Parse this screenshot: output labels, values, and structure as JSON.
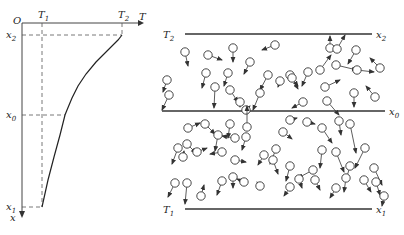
{
  "profile_graph": {
    "origin_label": "O",
    "t_axis_label": "T",
    "x_axis_label": "x",
    "t_ticks": [
      {
        "label": "T",
        "sub": "1",
        "x": 42
      },
      {
        "label": "T",
        "sub": "2",
        "x": 122
      }
    ],
    "x_ticks": [
      {
        "label": "x",
        "sub": "2",
        "y": 35
      },
      {
        "label": "x",
        "sub": "0",
        "y": 115
      },
      {
        "label": "x",
        "sub": "1",
        "y": 207
      }
    ],
    "curve_points": [
      [
        122,
        35
      ],
      [
        118,
        40
      ],
      [
        108,
        50
      ],
      [
        96,
        62
      ],
      [
        86,
        74
      ],
      [
        78,
        86
      ],
      [
        72,
        98
      ],
      [
        67,
        110
      ],
      [
        65,
        115
      ],
      [
        60,
        135
      ],
      [
        54,
        157
      ],
      [
        48,
        180
      ],
      [
        42,
        207
      ]
    ]
  },
  "molecule_panel": {
    "plates": [
      {
        "name": "top-plate",
        "temp_label": "T",
        "temp_sub": "2",
        "pos_label": "x",
        "pos_sub": "2",
        "y": 34
      },
      {
        "name": "mid-plane",
        "temp_label": "",
        "temp_sub": "",
        "pos_label": "x",
        "pos_sub": "0",
        "y": 111
      },
      {
        "name": "bottom-plate",
        "temp_label": "T",
        "temp_sub": "1",
        "pos_label": "x",
        "pos_sub": "1",
        "y": 209
      }
    ],
    "molecules": [
      [
        185,
        52,
        188,
        66
      ],
      [
        208,
        55,
        222,
        60
      ],
      [
        233,
        48,
        233,
        62
      ],
      [
        250,
        62,
        244,
        74
      ],
      [
        275,
        45,
        262,
        50
      ],
      [
        268,
        75,
        260,
        90
      ],
      [
        290,
        75,
        298,
        89
      ],
      [
        308,
        72,
        302,
        86
      ],
      [
        330,
        48,
        330,
        36
      ],
      [
        320,
        70,
        331,
        55
      ],
      [
        336,
        65,
        357,
        70
      ],
      [
        337,
        49,
        345,
        35
      ],
      [
        356,
        50,
        348,
        64
      ],
      [
        357,
        70,
        374,
        72
      ],
      [
        380,
        68,
        370,
        58
      ],
      [
        375,
        97,
        366,
        86
      ],
      [
        354,
        93,
        354,
        107
      ],
      [
        327,
        101,
        339,
        115
      ],
      [
        303,
        102,
        292,
        108
      ],
      [
        325,
        87,
        340,
        80
      ],
      [
        167,
        80,
        163,
        92
      ],
      [
        169,
        95,
        162,
        110
      ],
      [
        206,
        73,
        202,
        88
      ],
      [
        228,
        73,
        224,
        86
      ],
      [
        215,
        87,
        214,
        108
      ],
      [
        230,
        90,
        238,
        102
      ],
      [
        240,
        102,
        240,
        107
      ],
      [
        280,
        81,
        278,
        87
      ],
      [
        292,
        78,
        298,
        86
      ],
      [
        260,
        93,
        253,
        110
      ],
      [
        246,
        110,
        250,
        106
      ],
      [
        188,
        128,
        200,
        123
      ],
      [
        205,
        124,
        215,
        134
      ],
      [
        230,
        124,
        228,
        138
      ],
      [
        235,
        138,
        222,
        136
      ],
      [
        246,
        137,
        242,
        150
      ],
      [
        283,
        132,
        292,
        139
      ],
      [
        276,
        149,
        270,
        164
      ],
      [
        290,
        120,
        297,
        118
      ],
      [
        307,
        122,
        315,
        124
      ],
      [
        322,
        128,
        332,
        143
      ],
      [
        339,
        121,
        341,
        135
      ],
      [
        350,
        124,
        356,
        153
      ],
      [
        247,
        127,
        247,
        106
      ],
      [
        178,
        148,
        172,
        164
      ],
      [
        187,
        144,
        196,
        153
      ],
      [
        183,
        157,
        184,
        151
      ],
      [
        197,
        152,
        207,
        148
      ],
      [
        218,
        135,
        215,
        151
      ],
      [
        222,
        152,
        210,
        154
      ],
      [
        235,
        160,
        246,
        162
      ],
      [
        264,
        155,
        258,
        165
      ],
      [
        273,
        160,
        278,
        174
      ],
      [
        290,
        166,
        286,
        181
      ],
      [
        313,
        170,
        298,
        178
      ],
      [
        322,
        150,
        320,
        168
      ],
      [
        336,
        152,
        344,
        172
      ],
      [
        350,
        166,
        346,
        180
      ],
      [
        365,
        148,
        355,
        168
      ],
      [
        374,
        168,
        382,
        185
      ],
      [
        175,
        183,
        168,
        197
      ],
      [
        187,
        183,
        185,
        204
      ],
      [
        201,
        196,
        204,
        185
      ],
      [
        222,
        181,
        217,
        195
      ],
      [
        233,
        177,
        233,
        188
      ],
      [
        244,
        182,
        237,
        179
      ],
      [
        260,
        186,
        257,
        182
      ],
      [
        290,
        187,
        284,
        196
      ],
      [
        299,
        179,
        302,
        188
      ],
      [
        315,
        180,
        320,
        190
      ],
      [
        336,
        188,
        330,
        198
      ],
      [
        346,
        178,
        344,
        192
      ],
      [
        364,
        180,
        371,
        192
      ],
      [
        376,
        182,
        380,
        195
      ],
      [
        384,
        196,
        382,
        206
      ]
    ]
  }
}
